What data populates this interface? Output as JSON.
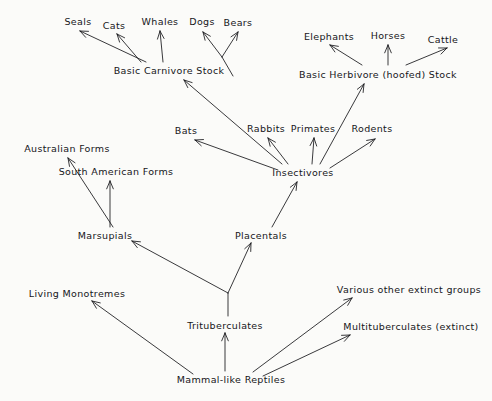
{
  "diagram": {
    "type": "diagram",
    "background_color": "#fbfbf9",
    "ink_color": "#16161a",
    "nodes": [
      {
        "id": "seals",
        "label": "Seals",
        "x": 78,
        "y": 21
      },
      {
        "id": "cats",
        "label": "Cats",
        "x": 114,
        "y": 25
      },
      {
        "id": "whales",
        "label": "Whales",
        "x": 160,
        "y": 21
      },
      {
        "id": "dogs",
        "label": "Dogs",
        "x": 202,
        "y": 21
      },
      {
        "id": "bears",
        "label": "Bears",
        "x": 238,
        "y": 22
      },
      {
        "id": "elephants",
        "label": "Elephants",
        "x": 329,
        "y": 36
      },
      {
        "id": "horses",
        "label": "Horses",
        "x": 388,
        "y": 35
      },
      {
        "id": "cattle",
        "label": "Cattle",
        "x": 443,
        "y": 39
      },
      {
        "id": "basic-carnivore",
        "label": "Basic  Carnivore  Stock",
        "x": 169,
        "y": 70
      },
      {
        "id": "basic-herbivore",
        "label": "Basic  Herbivore  (hoofed)  Stock",
        "x": 378,
        "y": 74
      },
      {
        "id": "bats",
        "label": "Bats",
        "x": 186,
        "y": 130
      },
      {
        "id": "rabbits",
        "label": "Rabbits",
        "x": 266,
        "y": 128
      },
      {
        "id": "primates",
        "label": "Primates",
        "x": 313,
        "y": 128
      },
      {
        "id": "rodents",
        "label": "Rodents",
        "x": 372,
        "y": 128
      },
      {
        "id": "insectivores",
        "label": "Insectivores",
        "x": 303,
        "y": 172
      },
      {
        "id": "australian-forms",
        "label": "Australian  Forms",
        "x": 67,
        "y": 148
      },
      {
        "id": "south-american-forms",
        "label": "South  American  Forms",
        "x": 116,
        "y": 171
      },
      {
        "id": "marsupials",
        "label": "Marsupials",
        "x": 105,
        "y": 235
      },
      {
        "id": "placentals",
        "label": "Placentals",
        "x": 261,
        "y": 235
      },
      {
        "id": "living-monotremes",
        "label": "Living  Monotremes",
        "x": 77,
        "y": 293
      },
      {
        "id": "trituberculates",
        "label": "Trituberculates",
        "x": 225,
        "y": 325
      },
      {
        "id": "various-extinct",
        "label": "Various  other  extinct  groups",
        "x": 409,
        "y": 289
      },
      {
        "id": "multituberculates",
        "label": "Multituberculates  (extinct)",
        "x": 411,
        "y": 326
      },
      {
        "id": "mammal-like-reptiles",
        "label": "Mammal-like  Reptiles",
        "x": 231,
        "y": 379
      }
    ],
    "arrows": [
      {
        "id": "carnivore-to-seals",
        "from": "basic-carnivore",
        "to": "seals",
        "x1": 146,
        "y1": 62,
        "x2": 80,
        "y2": 31
      },
      {
        "id": "carnivore-to-cats",
        "from": "basic-carnivore",
        "to": "cats",
        "x1": 141,
        "y1": 62,
        "x2": 117,
        "y2": 34
      },
      {
        "id": "carnivore-to-whales",
        "from": "basic-carnivore",
        "to": "whales",
        "x1": 163,
        "y1": 62,
        "x2": 160,
        "y2": 31
      },
      {
        "id": "carnivore-to-dogs",
        "from": "basic-carnivore",
        "to": "dogs",
        "x1": 222,
        "y1": 57,
        "x2": 203,
        "y2": 32
      },
      {
        "id": "carnivore-to-bears",
        "from": "basic-carnivore",
        "to": "bears",
        "x1": 222,
        "y1": 57,
        "x2": 238,
        "y2": 32
      },
      {
        "id": "dogs-bears-stem",
        "from": "basic-carnivore",
        "to": "dogs-bears-fork",
        "x1": 233,
        "y1": 76,
        "x2": 222,
        "y2": 57,
        "arrowhead": false
      },
      {
        "id": "herbivore-to-elephants",
        "from": "basic-herbivore",
        "to": "elephants",
        "x1": 362,
        "y1": 65,
        "x2": 330,
        "y2": 45
      },
      {
        "id": "herbivore-to-horses",
        "from": "basic-herbivore",
        "to": "horses",
        "x1": 388,
        "y1": 65,
        "x2": 388,
        "y2": 45
      },
      {
        "id": "herbivore-to-cattle",
        "from": "basic-herbivore",
        "to": "cattle",
        "x1": 406,
        "y1": 65,
        "x2": 447,
        "y2": 48
      },
      {
        "id": "insectivores-to-carnivore",
        "from": "insectivores",
        "to": "basic-carnivore",
        "x1": 282,
        "y1": 164,
        "x2": 184,
        "y2": 80
      },
      {
        "id": "insectivores-to-herbivore",
        "from": "insectivores",
        "to": "basic-herbivore",
        "x1": 320,
        "y1": 164,
        "x2": 364,
        "y2": 84
      },
      {
        "id": "insectivores-to-bats",
        "from": "insectivores",
        "to": "bats",
        "x1": 278,
        "y1": 170,
        "x2": 195,
        "y2": 140
      },
      {
        "id": "insectivores-to-rabbits",
        "from": "insectivores",
        "to": "rabbits",
        "x1": 288,
        "y1": 164,
        "x2": 268,
        "y2": 138
      },
      {
        "id": "insectivores-to-primates",
        "from": "insectivores",
        "to": "primates",
        "x1": 312,
        "y1": 164,
        "x2": 314,
        "y2": 138
      },
      {
        "id": "insectivores-to-rodents",
        "from": "insectivores",
        "to": "rodents",
        "x1": 330,
        "y1": 168,
        "x2": 375,
        "y2": 139
      },
      {
        "id": "placentals-to-insectivores",
        "from": "placentals",
        "to": "insectivores",
        "x1": 272,
        "y1": 227,
        "x2": 297,
        "y2": 182
      },
      {
        "id": "marsupials-to-australian",
        "from": "marsupials",
        "to": "australian-forms",
        "x1": 113,
        "y1": 227,
        "x2": 68,
        "y2": 158
      },
      {
        "id": "marsupials-to-south-american",
        "from": "marsupials",
        "to": "south-american-forms",
        "x1": 110,
        "y1": 227,
        "x2": 110,
        "y2": 181
      },
      {
        "id": "trituberculates-to-marsupials",
        "from": "trituberculates",
        "to": "marsupials",
        "x1": 228,
        "y1": 293,
        "x2": 132,
        "y2": 241
      },
      {
        "id": "trituberculates-to-placentals",
        "from": "trituberculates",
        "to": "placentals",
        "x1": 228,
        "y1": 293,
        "x2": 251,
        "y2": 243
      },
      {
        "id": "trituberculates-fork-stem",
        "from": "trituberculates",
        "to": "marsupial-placental-fork",
        "x1": 228,
        "y1": 316,
        "x2": 228,
        "y2": 293,
        "arrowhead": false
      },
      {
        "id": "reptiles-to-trituberculates",
        "from": "mammal-like-reptiles",
        "to": "trituberculates",
        "x1": 225,
        "y1": 371,
        "x2": 225,
        "y2": 333
      },
      {
        "id": "reptiles-to-monotremes",
        "from": "mammal-like-reptiles",
        "to": "living-monotremes",
        "x1": 193,
        "y1": 374,
        "x2": 92,
        "y2": 301
      },
      {
        "id": "reptiles-to-various-extinct",
        "from": "mammal-like-reptiles",
        "to": "various-extinct",
        "x1": 253,
        "y1": 372,
        "x2": 352,
        "y2": 298
      },
      {
        "id": "reptiles-to-multituberculates",
        "from": "mammal-like-reptiles",
        "to": "multituberculates",
        "x1": 263,
        "y1": 376,
        "x2": 350,
        "y2": 335
      }
    ]
  }
}
